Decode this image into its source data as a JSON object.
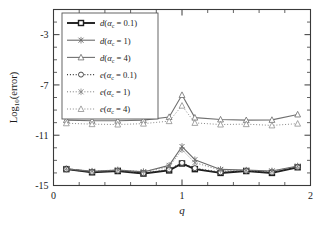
{
  "chart_data": {
    "type": "line",
    "title": "",
    "xlabel": "q",
    "ylabel": "Log10(error)",
    "xlim": [
      0,
      2
    ],
    "ylim": [
      -15,
      -1
    ],
    "grid": false,
    "legend_position": "upper-left-inside",
    "x_ticks_major": [
      0,
      1,
      2
    ],
    "x_ticks_major_labels": [
      "0",
      "1",
      "2"
    ],
    "x_ticks_minor": [
      0.2,
      0.4,
      0.6,
      0.8,
      1.2,
      1.4,
      1.6,
      1.8
    ],
    "y_ticks_major": [
      -3,
      -7,
      -11,
      -15
    ],
    "y_ticks_major_labels": [
      "-3",
      "-7",
      "-11",
      "-15"
    ],
    "y_ticks_minor": [
      -2,
      -4,
      -5,
      -6,
      -8,
      -9,
      -10,
      -12,
      -13,
      -14
    ],
    "x": [
      0.1,
      0.3,
      0.5,
      0.7,
      0.9,
      1.0,
      1.1,
      1.3,
      1.5,
      1.7,
      1.9
    ],
    "series": [
      {
        "name": "d(a_c = 0.1)",
        "label": "d(αc = 0.1)",
        "fn": "d",
        "alpha_c": "0.1",
        "linestyle": "solid",
        "marker": "square",
        "color": "#1d1d1d",
        "linewidth": 1.9,
        "values": [
          -13.7,
          -13.95,
          -13.85,
          -14.05,
          -13.8,
          -13.25,
          -13.7,
          -14.0,
          -13.85,
          -14.0,
          -13.55
        ]
      },
      {
        "name": "d(a_c = 1)",
        "label": "d(αc = 1)",
        "fn": "d",
        "alpha_c": "1",
        "linestyle": "solid",
        "marker": "x",
        "color": "#6a6a6a",
        "linewidth": 1.1,
        "values": [
          -13.68,
          -13.88,
          -13.78,
          -13.92,
          -13.4,
          -11.9,
          -12.95,
          -13.72,
          -13.78,
          -13.85,
          -13.45
        ]
      },
      {
        "name": "d(a_c = 4)",
        "label": "d(αc = 4)",
        "fn": "d",
        "alpha_c": "4",
        "linestyle": "solid",
        "marker": "triangle",
        "color": "#707070",
        "linewidth": 1.1,
        "values": [
          -9.8,
          -9.85,
          -9.85,
          -9.8,
          -9.55,
          -7.8,
          -9.6,
          -9.75,
          -9.8,
          -9.78,
          -9.35
        ]
      },
      {
        "name": "e(a_c = 0.1)",
        "label": "e(αc = 0.1)",
        "fn": "e",
        "alpha_c": "0.1",
        "linestyle": "dotted",
        "marker": "circle",
        "color": "#3a3a3a",
        "linewidth": 1.2,
        "values": [
          -13.7,
          -13.93,
          -13.83,
          -14.02,
          -13.72,
          -13.2,
          -13.62,
          -13.95,
          -13.83,
          -13.96,
          -13.52
        ]
      },
      {
        "name": "e(a_c = 1)",
        "label": "e(αc = 1)",
        "fn": "e",
        "alpha_c": "1",
        "linestyle": "dotted",
        "marker": "x",
        "color": "#7b7b7b",
        "linewidth": 1.0,
        "values": [
          -13.66,
          -13.86,
          -13.76,
          -13.9,
          -13.52,
          -12.15,
          -13.18,
          -13.78,
          -13.8,
          -13.86,
          -13.48
        ]
      },
      {
        "name": "e(a_c = 4)",
        "label": "e(αc = 4)",
        "fn": "e",
        "alpha_c": "4",
        "linestyle": "dotted",
        "marker": "triangle",
        "color": "#8a8a8a",
        "linewidth": 1.0,
        "values": [
          -10.05,
          -10.12,
          -10.15,
          -10.08,
          -9.88,
          -8.65,
          -10.02,
          -10.15,
          -10.12,
          -10.22,
          -10.08
        ]
      }
    ]
  },
  "legend": {
    "entries": [
      {
        "fn": "d",
        "paren_open": "(",
        "alpha": "α",
        "sub": "c",
        "eq": " = 0.1)"
      },
      {
        "fn": "d",
        "paren_open": "(",
        "alpha": "α",
        "sub": "c",
        "eq": " = 1)"
      },
      {
        "fn": "d",
        "paren_open": "(",
        "alpha": "α",
        "sub": "c",
        "eq": " = 4)"
      },
      {
        "fn": "e",
        "paren_open": "(",
        "alpha": "α",
        "sub": "c",
        "eq": " = 0.1)"
      },
      {
        "fn": "e",
        "paren_open": "(",
        "alpha": "α",
        "sub": "c",
        "eq": " = 1)"
      },
      {
        "fn": "e",
        "paren_open": "(",
        "alpha": "α",
        "sub": "c",
        "eq": " = 4)"
      }
    ]
  },
  "axis": {
    "y_title_main": "Log",
    "y_title_sub": "10",
    "y_title_rest": "(error)",
    "x_title": "q"
  }
}
